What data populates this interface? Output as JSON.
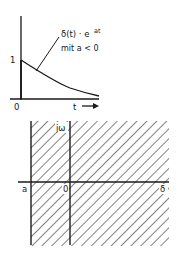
{
  "top_plot": {
    "function_label": "δ(t) · e",
    "exponent": "at",
    "condition_label": "mit  a < 0",
    "y_tick_1": "1",
    "origin_label": "0",
    "x_axis_label": "t",
    "curve": "exponential decay from 1 at t=0"
  },
  "bottom_plot": {
    "imag_axis_label": "jω",
    "real_axis_label": "δ",
    "a_label": "a",
    "origin_label": "0",
    "region": "hatched half-plane Re > a"
  },
  "colors": {
    "ink": "#1a1a1a",
    "background": "#ffffff"
  }
}
